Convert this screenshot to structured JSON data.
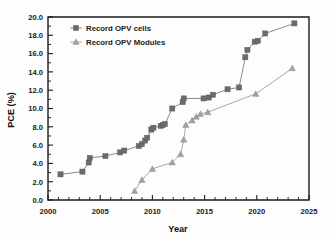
{
  "chart_data": {
    "type": "line",
    "title": "",
    "xlabel": "Year",
    "ylabel": "PCE (%)",
    "xlim": [
      2000,
      2025
    ],
    "ylim": [
      0.0,
      20.0
    ],
    "xticks": [
      2000,
      2005,
      2010,
      2015,
      2020,
      2025
    ],
    "xtick_labels": [
      "2000",
      "2005",
      "2010",
      "2015",
      "2020",
      "2025"
    ],
    "yticks": [
      0.0,
      2.0,
      4.0,
      6.0,
      8.0,
      10.0,
      12.0,
      14.0,
      16.0,
      18.0,
      20.0
    ],
    "ytick_labels": [
      "0.0",
      "2.0",
      "4.0",
      "6.0",
      "8.0",
      "10.0",
      "12.0",
      "14.0",
      "16.0",
      "18.0",
      "20.0"
    ],
    "grid": false,
    "legend_position": "upper left",
    "series": [
      {
        "name": "Record OPV cells",
        "marker": "square",
        "color": "#6b6b6b",
        "line_color": "#8a8a8a",
        "x": [
          2001.2,
          2003.3,
          2003.9,
          2004.0,
          2005.5,
          2006.9,
          2007.3,
          2008.7,
          2009.0,
          2009.3,
          2009.5,
          2009.9,
          2010.1,
          2010.8,
          2011.0,
          2011.2,
          2011.9,
          2012.9,
          2013.0,
          2014.9,
          2015.4,
          2015.8,
          2017.2,
          2018.3,
          2018.9,
          2019.1,
          2019.8,
          2020.1,
          2020.8,
          2023.6
        ],
        "y": [
          2.8,
          3.1,
          4.1,
          4.6,
          4.8,
          5.2,
          5.4,
          5.9,
          6.1,
          6.5,
          6.8,
          7.7,
          7.9,
          8.1,
          8.2,
          8.3,
          10.0,
          10.7,
          11.1,
          11.1,
          11.2,
          11.5,
          12.1,
          12.3,
          15.6,
          16.4,
          17.3,
          17.4,
          18.2,
          19.3
        ]
      },
      {
        "name": "Record OPV Modules",
        "marker": "triangle",
        "color": "#a0a0a0",
        "line_color": "#a9a9a9",
        "x": [
          2008.3,
          2009.0,
          2010.0,
          2011.9,
          2012.7,
          2013.0,
          2013.2,
          2013.8,
          2014.2,
          2014.6,
          2015.3,
          2019.9,
          2023.4
        ],
        "y": [
          1.0,
          2.2,
          3.4,
          4.1,
          5.0,
          6.6,
          8.2,
          8.7,
          9.1,
          9.4,
          9.6,
          11.6,
          14.4
        ]
      }
    ]
  },
  "legend": {
    "items": [
      {
        "label": "Record OPV cells",
        "marker": "square-marker-icon"
      },
      {
        "label": "Record OPV Modules",
        "marker": "triangle-marker-icon"
      }
    ]
  }
}
